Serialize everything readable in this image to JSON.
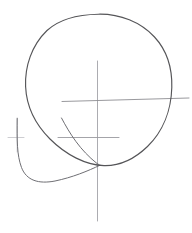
{
  "artwork": {
    "title": "Head Construction Sketch",
    "medium": "graphite pencil line drawing",
    "subject": "loomis-style head construction guide",
    "background_color": "#ffffff",
    "canvas": {
      "width": 192,
      "height": 233
    }
  },
  "palette": {
    "cranium_stroke": "#555558",
    "jaw_stroke": "#6f6f74",
    "guideline_strong": "#88888d",
    "guideline_faint": "#b6b6bb",
    "tick_faint": "#c3c3c8"
  },
  "strokes": {
    "cranium_ball": {
      "name": "cranium-ball",
      "description": "large slightly irregular circle forming the skull mass",
      "center": [
        98,
        90
      ],
      "radius_x": 73,
      "radius_y": 76,
      "bounds": {
        "left": 25,
        "top": 14,
        "right": 172,
        "bottom": 166
      },
      "color": "#555558",
      "width": 1.15,
      "path": "M 98.5 14.2 C 139 14.6 170.5 46.5 171.8 87.5 C 173.0 127.5 146.0 159.0 110.0 164.8 C 73.5 170.4 38.5 147.0 27.6 112.0 C 17.0 78.0 28.0 41.0 55.5 23.5 C 68.3 15.6 83.2 14.1 98.5 14.2 Z"
    },
    "jaw_mass": {
      "name": "jaw-mass",
      "description": "rounded U-shaped jaw / muzzle block projecting to the lower left",
      "color": "#6f6f74",
      "width": 1.0,
      "upper_path": "M 61.5 118.0 C 70.0 134.0 80.0 150.0 97.0 163.5 C 99.0 164.6 99.5 164.9 99.8 165.3",
      "lower_path": "M 17.2 118.2 C 17.0 140.0 16.8 155.0 21.5 167.5 C 26.5 180.5 38.5 184.2 55.0 181.0 C 72.0 177.5 88.0 171.0 99.8 165.3",
      "left_edge_top": [
        17.2,
        118.2
      ],
      "meeting_point": [
        99.8,
        165.3
      ]
    },
    "vertical_centerline": {
      "name": "vertical-centerline",
      "description": "faint vertical axis of symmetry running down through the head",
      "color": "#a3a3a8",
      "width": 0.9,
      "x": 97.5,
      "y_start": 61,
      "y_end": 221
    },
    "brow_guideline": {
      "name": "brow-eye-guideline",
      "description": "long horizontal eye / brow line crossing the ball and exiting right",
      "color": "#8d8d92",
      "width": 0.9,
      "x_start": 62,
      "x_end": 189,
      "y_left": 101.5,
      "y_right": 98.0
    },
    "nose_guideline": {
      "name": "nose-guideline",
      "description": "shorter horizontal nose-level line below the brow line",
      "color": "#9a9a9f",
      "width": 0.9,
      "x_start": 58,
      "x_end": 119,
      "y": 137.5
    },
    "jaw_tick": {
      "name": "jaw-corner-tick",
      "description": "small faint cross tick at the left jaw corner",
      "color": "#c0c0c5",
      "width": 0.8,
      "horizontal": {
        "x_start": 8,
        "x_end": 24,
        "y": 137.5
      },
      "vertical": {
        "x": 17.2,
        "y_start": 119,
        "y_end": 152
      }
    }
  },
  "labels": {
    "none_visible": ""
  }
}
